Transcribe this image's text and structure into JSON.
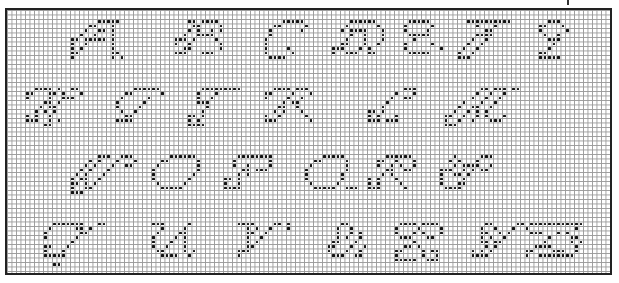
{
  "grid": {
    "cols": 134,
    "rows": 59,
    "cell_px": 4.5,
    "line_color": "#9a9a9a",
    "stitch_color": "#111111",
    "border_color": "#222222"
  },
  "rows_of_letters": [
    [
      "A",
      "B",
      "C",
      "D",
      "E",
      "F",
      "G"
    ],
    [
      "H",
      "I",
      "J",
      "K",
      "L",
      "M"
    ],
    [
      "N",
      "O",
      "P",
      "Q",
      "R",
      "S"
    ],
    [
      "T",
      "U",
      "V",
      "W",
      "X",
      "Y",
      "Z"
    ]
  ],
  "letters": [
    {
      "ch": "A",
      "col": 14,
      "row": 2,
      "bits": [
        "......xxxxx.",
        "....xx...x..",
        "...x..xx.x..",
        "..x..x...x..",
        "xx.xxxxx.x..",
        "x..x.....x..",
        "x.x......x..",
        "xx.......xx.",
        "x........x.x"
      ]
    },
    {
      "ch": "B",
      "col": 37,
      "row": 2,
      "bits": [
        "...xx.xxxx..",
        "....xx....x.",
        "...x.x..x.x.",
        "..x..xxxx...",
        "xxx.x....x..",
        "x..x......x.",
        "..xx......x.",
        "xxx...xxx...",
        "............"
      ]
    },
    {
      "ch": "C",
      "col": 57,
      "row": 2,
      "bits": [
        "....xxxxx...",
        "..xx.....x..",
        ".x......x...",
        ".x..........",
        "x...........",
        "x...........",
        "x....x......",
        "x.....x.....",
        ".xxxx......."
      ]
    },
    {
      "ch": "D",
      "col": 72,
      "row": 2,
      "bits": [
        "....xxxxxx..",
        "...x......x.",
        "..x.xxxx...x",
        "....x..x...x",
        "...x...x...x",
        "..xx...x..x.",
        "xxx...x.x...",
        "x..xxx..xx..",
        "............"
      ]
    },
    {
      "ch": "E",
      "col": 88,
      "row": 2,
      "bits": [
        ".xxxxx......",
        "x.....x.....",
        "x....x......",
        ".xxxxx......",
        "..x.........",
        "x.....x.....",
        "x.......x...",
        ".xxxxx......",
        "............"
      ]
    },
    {
      "ch": "F",
      "col": 100,
      "row": 2,
      "bits": [
        "..xxxxxxxxxx",
        "....x...x...",
        "......xx....",
        "....xxxx....",
        "...x..x.....",
        "..x..x......",
        ".x..x.......",
        "x..x........",
        "xxx........."
      ]
    },
    {
      "ch": "G",
      "col": 118,
      "row": 2,
      "bits": [
        "..xxx...",
        "xx...x..",
        "x.....x.",
        ".x..x...",
        "..xxx...",
        "...x....",
        "..x.....",
        "xx......",
        "xxxxx..."
      ]
    },
    {
      "ch": "H",
      "col": 4,
      "row": 17,
      "bits": [
        "..xxxx.x..xx.",
        "xx...xx.x...x",
        "x....x..xxx..",
        "....xx.x.....",
        "...x.xx......",
        "..x.x.x......",
        "x.x..x.......",
        "xxx..x.x.....",
        "....xx......."
      ]
    },
    {
      "ch": "I",
      "col": 24,
      "row": 17,
      "bits": [
        "....xxxxxx.",
        "..xx......x",
        ".x.....x...",
        "x.....x....",
        "x....x.....",
        ".x..x......",
        "..xx.......",
        "xxxx.......",
        "..........."
      ]
    },
    {
      "ch": "J",
      "col": 40,
      "row": 17,
      "bits": [
        "...xxxxxxxxx",
        "..x...x.....",
        "..x..x......",
        "..xxx.......",
        "....x.......",
        "...x........",
        "xx.x........",
        "x.x.........",
        "xxxx........"
      ]
    },
    {
      "ch": "K",
      "col": 57,
      "row": 17,
      "bits": [
        "..xxxx.xxx.",
        "xx....x...x",
        "x....x..x..",
        "....x.xx...",
        "...xx..x...",
        "..x.x...x..",
        "x..x.....x.",
        "xxx.......x",
        "..........."
      ]
    },
    {
      "ch": "L",
      "col": 80,
      "row": 17,
      "bits": [
        "........xxx",
        "......x...x",
        ".....x..xx.",
        "....x......",
        "...x.......",
        "xx.x.......",
        "x.x...x....",
        "xxx.xxx....",
        "..........."
      ]
    },
    {
      "ch": "M",
      "col": 97,
      "row": 17,
      "bits": [
        "........xx.xxx.xx",
        ".......x..x..x...",
        "......x..x..x....",
        "....x...x..x.....",
        "...x..xx..x......",
        "..x..x.x.x.......",
        "xx..x..x.x...x...",
        "x..x..x...xxx....",
        "xxx.............."
      ]
    },
    {
      "ch": "N",
      "col": 14,
      "row": 32,
      "bits": [
        "......xxx..xxx.",
        "....x.x...x...x",
        "...x.x...x..xx.",
        "..x.x...x......",
        ".x.x...x.......",
        "x.xx..x........",
        "xx.x.x.........",
        "x..xx..........",
        "xxx............"
      ]
    },
    {
      "ch": "O",
      "col": 32,
      "row": 32,
      "bits": [
        "....xxxxxx..",
        "..xx......x.",
        ".x........x.",
        "x.........x.",
        "x........x..",
        "x.......x...",
        ".x.....x....",
        "..xxxxx.....",
        "............"
      ]
    },
    {
      "ch": "P",
      "col": 48,
      "row": 32,
      "bits": [
        "...xxxxxxxx.",
        "..x.......x.",
        "..x..x....x.",
        "....xx.xxx..",
        "...x.x......",
        "xx.x........",
        "x..x........",
        "xxxx........",
        "............"
      ]
    },
    {
      "ch": "Q",
      "col": 66,
      "row": 32,
      "bits": [
        "....xxxxx...",
        "..xx.....x..",
        ".x.......x..",
        "x........x..",
        "x.......x...",
        "x.......x...",
        ".x.....x....",
        "..xxxxx..xxx",
        "............"
      ]
    },
    {
      "ch": "R",
      "col": 80,
      "row": 32,
      "bits": [
        "....xxxxxx..",
        "..xx..x...x.",
        "..x..x.x..x.",
        "....xx..xx..",
        "...x.x......",
        "x.x...x.....",
        "x.x....x....",
        "xxx.....x...",
        "............"
      ]
    },
    {
      "ch": "S",
      "col": 96,
      "row": 32,
      "bits": [
        "...x.....xxx",
        "..x.x...x...",
        "...x.xxxx..x",
        "xxx..x.x.xx.",
        "x..xx.x.....",
        "x....x......",
        "x...xx......",
        ".xxxx.......",
        "............"
      ]
    },
    {
      "ch": "T",
      "col": 8,
      "row": 47,
      "bits": [
        "..xxxxxxx...xx",
        ".x.....xx.x...",
        "x.......xx....",
        "x......x......",
        "......x.......",
        "xx...x........",
        "x...x.........",
        "xxxxx.........",
        "..............",
        "..xx.........."
      ]
    },
    {
      "ch": "U",
      "col": 32,
      "row": 47,
      "bits": [
        "xxx.....x...",
        "..x....x....",
        ".x....xx....",
        "x....x.x....",
        "x...x..x....",
        "x..x...x....",
        ".xx....x.x..",
        "..xxxx..x...",
        "............"
      ]
    },
    {
      "ch": "V",
      "col": 51,
      "row": 47,
      "bits": [
        "xxxx....xx.x",
        "..x.x..x...x",
        "..xx..x.....",
        "..x..x......",
        "..x.x.......",
        "..xx........",
        "xxx.........",
        "x...........",
        "............"
      ]
    },
    {
      "ch": "W",
      "col": 71,
      "row": 47,
      "bits": [
        "...xx.....",
        "..x..x....",
        "..x..x.x..",
        "..x.x..x..",
        ".xx...x...",
        "xx...x..x.",
        "x...x..x..",
        ".xxx..xx..",
        ".........."
      ]
    },
    {
      "ch": "X",
      "col": 86,
      "row": 47,
      "bits": [
        ".xxxx.xxxx.",
        "x....x....x",
        "x...x.x...x",
        ".xxx...xx..",
        "....x......",
        "..xx.x.....",
        "xx....x.xx.",
        "x.....x..x.",
        "xxxxx..xxx."
      ]
    },
    {
      "ch": "Y",
      "col": 103,
      "row": 47,
      "bits": [
        "...xx.....xx",
        "..x..x...x..",
        "..xx..x.x...",
        "..x.x..x....",
        "..xx.xx.....",
        "...x.x......",
        "x.x.x.......",
        "xxxx........",
        "............"
      ]
    },
    {
      "ch": "Z",
      "col": 115,
      "row": 47,
      "bits": [
        ".xxxxxxxxxxxx",
        "x..........x.",
        ".xxx...x.x...",
        ".....x....xx.",
        "....x.....x.x",
        "..xxxx.....x.",
        "xx....xxx..x.",
        "x..xxxxxxxx..",
        "............."
      ]
    }
  ]
}
